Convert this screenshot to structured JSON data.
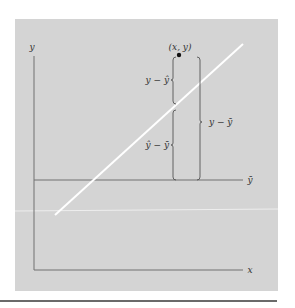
{
  "figure": {
    "panel_color": "#d4d4d4",
    "axis_color": "#707070",
    "line_color": "#ffffff",
    "rule_color": "#6a6a6a",
    "labels": {
      "y_axis": "y",
      "x_axis": "x",
      "mean_line": "ȳ",
      "point": "(x, y)",
      "residual": "y − ŷ",
      "explained": "ŷ − ȳ",
      "total": "y − ȳ"
    }
  }
}
